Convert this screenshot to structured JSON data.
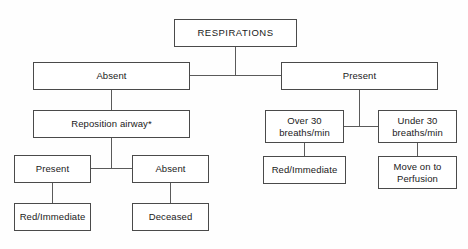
{
  "diagram": {
    "footnote_marker": "*",
    "nodes": {
      "respirations": {
        "label": "RESPIRATIONS"
      },
      "absent_top": {
        "label": "Absent"
      },
      "present_top": {
        "label": "Present"
      },
      "reposition_airway": {
        "label": "Reposition airway*"
      },
      "present_after": {
        "label": "Present"
      },
      "absent_after": {
        "label": "Absent"
      },
      "red_immediate_left": {
        "label": "Red/Immediate"
      },
      "deceased": {
        "label": "Deceased"
      },
      "over_30": {
        "label": "Over 30\nbreaths/min"
      },
      "under_30": {
        "label": "Under 30\nbreaths/min"
      },
      "red_immediate_right": {
        "label": "Red/Immediate"
      },
      "move_on_perfusion": {
        "label": "Move on to\nPerfusion"
      }
    },
    "colors": {
      "box_border": "#4a4a4a",
      "connector": "#5a5a5a",
      "text": "#1a1a1a",
      "background": "#fefefe"
    }
  }
}
